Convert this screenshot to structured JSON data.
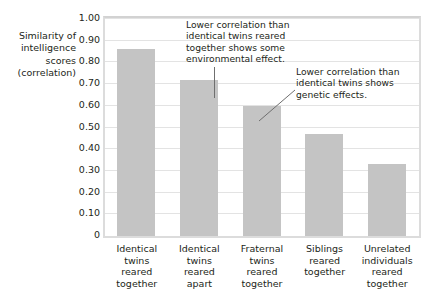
{
  "chart_data": {
    "type": "bar",
    "title": "",
    "xlabel": "",
    "ylabel": "Similarity of intelligence scores (correlation)",
    "ylabel_lines": [
      "Similarity of",
      "intelligence",
      "scores",
      "(correlation)"
    ],
    "categories": [
      "Identical twins reared together",
      "Identical twins reared apart",
      "Fraternal twins reared together",
      "Siblings reared together",
      "Unrelated individuals reared together"
    ],
    "category_lines": [
      [
        "Identical",
        "twins",
        "reared",
        "together"
      ],
      [
        "Identical",
        "twins",
        "reared",
        "apart"
      ],
      [
        "Fraternal",
        "twins",
        "reared",
        "together"
      ],
      [
        "Siblings",
        "reared",
        "together"
      ],
      [
        "Unrelated",
        "individuals",
        "reared",
        "together"
      ]
    ],
    "values": [
      0.86,
      0.72,
      0.6,
      0.47,
      0.33
    ],
    "ylim": [
      0,
      1.0
    ],
    "ytick_values": [
      0,
      0.1,
      0.2,
      0.3,
      0.4,
      0.5,
      0.6,
      0.7,
      0.8,
      0.9,
      1.0
    ],
    "ytick_labels": [
      "0",
      "0.10",
      "0.20",
      "0.30",
      "0.40",
      "0.50",
      "0.60",
      "0.70",
      "0.80",
      "0.90",
      "1.00"
    ],
    "grid": true,
    "legend": "none",
    "bar_color": "#c4c4c4",
    "gridline_color": "#e3e3e3",
    "frame_color": "#dcdcdc",
    "text_color": "#231f20",
    "annotations": [
      {
        "id": "environmental",
        "lines": [
          "Lower correlation than",
          "identical twins reared",
          "together shows some",
          "environmental effect."
        ],
        "points_to_category": "Identical twins reared apart"
      },
      {
        "id": "genetic",
        "lines": [
          "Lower correlation than",
          "identical twins shows",
          "genetic effects."
        ],
        "points_to_category": "Fraternal twins reared together"
      }
    ]
  }
}
